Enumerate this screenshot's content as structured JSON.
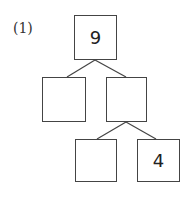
{
  "problem": {
    "label": "(1)",
    "tree": {
      "root": {
        "value": "9"
      },
      "middle_left": {
        "value": ""
      },
      "middle_right": {
        "value": ""
      },
      "bottom_left": {
        "value": ""
      },
      "bottom_right": {
        "value": "4"
      }
    }
  }
}
